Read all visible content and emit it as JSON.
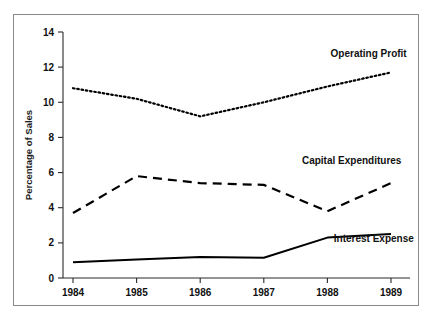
{
  "chart_data": {
    "type": "line",
    "title": "",
    "xlabel": "",
    "ylabel": "Percentage of Sales",
    "categories": [
      "1984",
      "1985",
      "1986",
      "1987",
      "1988",
      "1989"
    ],
    "x": [
      1984,
      1985,
      1986,
      1987,
      1988,
      1989
    ],
    "xlim": [
      1984,
      1989
    ],
    "ylim": [
      0,
      14
    ],
    "yticks": [
      0,
      2,
      4,
      6,
      8,
      10,
      12,
      14
    ],
    "ytick_labels": [
      "0",
      "2",
      "4",
      "6",
      "8",
      "10",
      "12",
      "14"
    ],
    "xticks": [
      1984,
      1985,
      1986,
      1987,
      1988,
      1989
    ],
    "xtick_labels": [
      "1984",
      "1985",
      "1986",
      "1987",
      "1988",
      "1989"
    ],
    "grid": false,
    "legend_position": "inline-annotations",
    "series": [
      {
        "name": "Operating Profit",
        "style": "dotted",
        "color": "#000000",
        "values": [
          10.8,
          10.2,
          9.2,
          10.0,
          10.9,
          11.7
        ],
        "label_anchor": {
          "x": 1988.05,
          "y": 12.6
        }
      },
      {
        "name": "Capital Expenditures",
        "style": "dashed",
        "color": "#000000",
        "values": [
          3.7,
          5.8,
          5.4,
          5.3,
          3.8,
          5.4
        ],
        "label_anchor": {
          "x": 1987.6,
          "y": 6.5
        }
      },
      {
        "name": "Interest Expense",
        "style": "solid",
        "color": "#000000",
        "values": [
          0.9,
          1.05,
          1.2,
          1.15,
          2.3,
          2.5
        ],
        "label_anchor": {
          "x": 1988.1,
          "y": 2.05
        }
      }
    ]
  },
  "axes": {
    "y_axis_title": "Percentage of Sales"
  },
  "annotations": {
    "operating_profit": "Operating Profit",
    "capital_expenditures": "Capital Expenditures",
    "interest_expense": "Interest Expense"
  },
  "ticks": {
    "y": [
      "14",
      "12",
      "10",
      "8",
      "6",
      "4",
      "2",
      "0"
    ],
    "x": [
      "1984",
      "1985",
      "1986",
      "1987",
      "1988",
      "1989"
    ]
  }
}
